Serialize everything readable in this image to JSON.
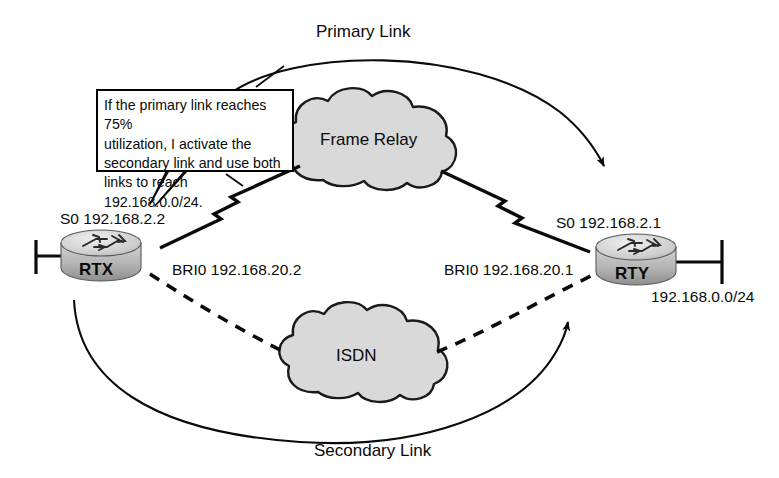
{
  "diagram": {
    "colors": {
      "line": "#0a0a0a",
      "cloud_fill": "#d9d9d9",
      "cloud_stroke": "#1a1a1a",
      "router_body": "#c0c0c0",
      "router_top": "#e3e3e3",
      "background": "#ffffff"
    },
    "annotations": {
      "primary_link": "Primary Link",
      "secondary_link": "Secondary Link"
    },
    "callout": {
      "lines": [
        "If the primary link reaches 75%",
        "utilization, I activate the",
        "secondary link and use both",
        "links to reach 192.168.0.0/24."
      ],
      "text": "If the primary link reaches 75% utilization, I activate the secondary link and use both links to reach 192.168.0.0/24."
    },
    "clouds": [
      {
        "name": "frame-relay-cloud",
        "label": "Frame Relay"
      },
      {
        "name": "isdn-cloud",
        "label": "ISDN"
      }
    ],
    "routers": [
      {
        "name": "router-rtx",
        "label": "RTX"
      },
      {
        "name": "router-rty",
        "label": "RTY"
      }
    ],
    "interfaces": {
      "rtx_serial": "S0 192.168.2.2",
      "rtx_bri": "BRI0 192.168.20.2",
      "rty_serial": "S0 192.168.2.1",
      "rty_bri": "BRI0 192.168.20.1"
    },
    "networks": {
      "lan": "192.168.0.0/24"
    }
  }
}
